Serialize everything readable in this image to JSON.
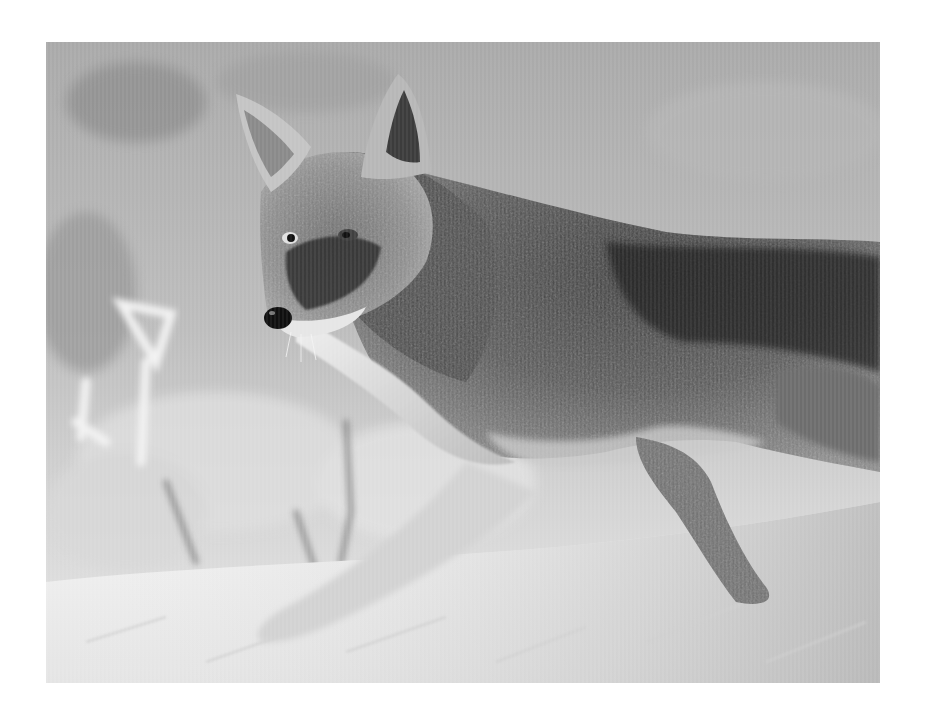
{
  "image": {
    "subject": "Coyote trotting through snow",
    "style": "black and white photograph",
    "alt": "A black and white photo of a coyote walking through snow, looking back over its shoulder, with frosted shrubs blurred in the background",
    "frame": {
      "x": 46,
      "y": 42,
      "width": 834,
      "height": 641
    },
    "page_background": "#ffffff",
    "tones": {
      "background_upper": "#a8a8a8",
      "background_mid": "#c4c4c4",
      "snow": "#f2f2f2",
      "fur_dark": "#2a2a2a",
      "fur_mid": "#7d7d7d",
      "fur_light": "#d9d9d9",
      "nose": "#111111"
    }
  }
}
